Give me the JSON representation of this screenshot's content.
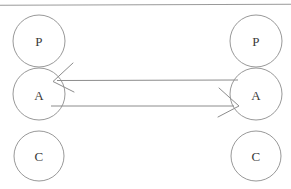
{
  "figure": {
    "title": "",
    "width": 291,
    "height": 189,
    "background_color": "#ffffff",
    "stroke_color": "#8c8c8c",
    "text_color": "#3a3a3a",
    "top_rule": {
      "x1": 0,
      "y1": 5,
      "x2": 291,
      "y2": 4
    }
  },
  "diagram_data": {
    "type": "node-link-diagram",
    "description": "Two vertical stacks of three tangent circles labelled P, A, C connected by two horizontal arrows between the A nodes",
    "nodes": [
      {
        "id": "left-p",
        "label": "P",
        "cx": 39,
        "cy": 41,
        "r": 26,
        "column": "left",
        "row": 0
      },
      {
        "id": "left-a",
        "label": "A",
        "cx": 39,
        "cy": 94,
        "r": 26,
        "column": "left",
        "row": 1
      },
      {
        "id": "left-c",
        "label": "C",
        "cx": 39,
        "cy": 156,
        "r": 25,
        "column": "left",
        "row": 2
      },
      {
        "id": "right-p",
        "label": "P",
        "cx": 256,
        "cy": 41,
        "r": 26,
        "column": "right",
        "row": 0
      },
      {
        "id": "right-a",
        "label": "A",
        "cx": 256,
        "cy": 94,
        "r": 26,
        "column": "right",
        "row": 1
      },
      {
        "id": "right-c",
        "label": "C",
        "cx": 256,
        "cy": 156,
        "r": 25,
        "column": "right",
        "row": 2
      }
    ],
    "edges": [
      {
        "id": "edge-right-to-left",
        "from": "right-a",
        "to": "left-a",
        "direction": "leftward",
        "label": "",
        "x1": 238,
        "y1": 80,
        "x2": 53,
        "y2": 81,
        "arrowhead": "open-v",
        "arrowhead_at": "left-a"
      },
      {
        "id": "edge-left-to-right",
        "from": "left-a",
        "to": "right-a",
        "direction": "rightward",
        "label": "",
        "x1": 51,
        "y1": 106,
        "x2": 239,
        "y2": 106,
        "arrowhead": "open-v",
        "arrowhead_at": "right-a"
      }
    ]
  }
}
